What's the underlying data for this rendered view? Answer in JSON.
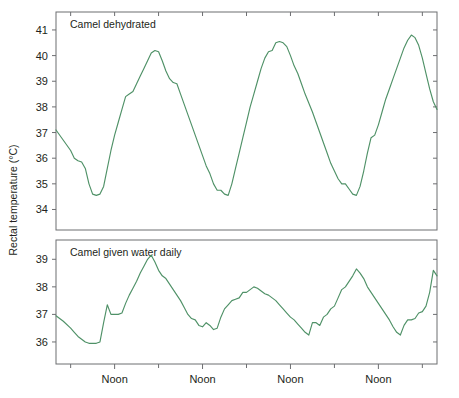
{
  "figure": {
    "background_color": "#ffffff",
    "axis_color": "#6d6e71",
    "text_color": "#231f20",
    "y_axis_title": "Rectal temperature (°C)"
  },
  "chart_data": {
    "type": "line",
    "title": "",
    "xlabel": "",
    "ylabel": "Rectal temperature (°C)",
    "grid": false,
    "legend": "none",
    "line_color": "#4f9167",
    "x_tick_labels": [
      "Noon",
      "Noon",
      "Noon",
      "Noon"
    ],
    "x_tick_label_positions_hours": [
      12,
      36,
      60,
      84
    ],
    "x_minor_tick_positions_hours": [
      0,
      24,
      48,
      72,
      96
    ],
    "xlim_hours": [
      -4,
      100
    ],
    "panels": [
      {
        "name": "camel-dehydrated",
        "label": "Camel dehydrated",
        "ylim": [
          33.2,
          41.7
        ],
        "y_ticks": [
          34,
          35,
          36,
          37,
          38,
          39,
          40,
          41
        ],
        "x": [
          -4,
          -2,
          0,
          1,
          2,
          3,
          4,
          5,
          6,
          7,
          8,
          9,
          10,
          11,
          12,
          13,
          14,
          15,
          16,
          17,
          18,
          19,
          20,
          21,
          22,
          23,
          24,
          25,
          26,
          27,
          28,
          29,
          30,
          31,
          32,
          33,
          34,
          35,
          36,
          37,
          38,
          39,
          40,
          41,
          42,
          43,
          44,
          45,
          46,
          47,
          48,
          49,
          50,
          51,
          52,
          53,
          54,
          55,
          56,
          57,
          58,
          59,
          60,
          61,
          62,
          63,
          64,
          65,
          66,
          67,
          68,
          69,
          70,
          71,
          72,
          73,
          74,
          75,
          76,
          77,
          78,
          79,
          80,
          81,
          82,
          83,
          84,
          85,
          86,
          87,
          88,
          89,
          90,
          91,
          92,
          93,
          94,
          95,
          96,
          97,
          98,
          99,
          100
        ],
        "y": [
          37.1,
          36.7,
          36.3,
          36.0,
          35.9,
          35.85,
          35.6,
          35.0,
          34.6,
          34.55,
          34.6,
          34.9,
          35.6,
          36.3,
          36.9,
          37.4,
          37.9,
          38.4,
          38.5,
          38.6,
          38.9,
          39.2,
          39.5,
          39.8,
          40.1,
          40.2,
          40.15,
          39.8,
          39.4,
          39.1,
          38.95,
          38.9,
          38.5,
          38.1,
          37.7,
          37.3,
          36.9,
          36.5,
          36.1,
          35.7,
          35.4,
          35.0,
          34.75,
          34.75,
          34.6,
          34.55,
          35.0,
          35.6,
          36.2,
          36.8,
          37.4,
          38.0,
          38.5,
          39.0,
          39.5,
          39.9,
          40.15,
          40.2,
          40.5,
          40.55,
          40.5,
          40.35,
          40.0,
          39.6,
          39.3,
          38.9,
          38.5,
          38.15,
          37.8,
          37.4,
          37.0,
          36.6,
          36.2,
          35.8,
          35.5,
          35.2,
          35.0,
          35.0,
          34.8,
          34.6,
          34.55,
          34.9,
          35.5,
          36.2,
          36.8,
          36.9,
          37.3,
          37.8,
          38.3,
          38.7,
          39.1,
          39.5,
          39.9,
          40.3,
          40.6,
          40.8,
          40.7,
          40.4,
          39.9,
          39.3,
          38.7,
          38.2,
          37.9
        ]
      },
      {
        "name": "camel-given-water-daily",
        "label": "Camel given water daily",
        "ylim": [
          35.2,
          39.7
        ],
        "y_ticks": [
          36,
          37,
          38,
          39
        ],
        "x": [
          -4,
          -2,
          0,
          1,
          2,
          3,
          4,
          5,
          6,
          7,
          8,
          9,
          10,
          11,
          12,
          13,
          14,
          15,
          16,
          17,
          18,
          19,
          20,
          21,
          22,
          23,
          24,
          25,
          26,
          27,
          28,
          29,
          30,
          31,
          32,
          33,
          34,
          35,
          36,
          37,
          38,
          39,
          40,
          41,
          42,
          43,
          44,
          45,
          46,
          47,
          48,
          49,
          50,
          51,
          52,
          53,
          54,
          55,
          56,
          57,
          58,
          59,
          60,
          61,
          62,
          63,
          64,
          65,
          66,
          67,
          68,
          69,
          70,
          71,
          72,
          73,
          74,
          75,
          76,
          77,
          78,
          79,
          80,
          81,
          82,
          83,
          84,
          85,
          86,
          87,
          88,
          89,
          90,
          91,
          92,
          93,
          94,
          95,
          96,
          97,
          98,
          99,
          100
        ],
        "y": [
          36.95,
          36.75,
          36.5,
          36.35,
          36.2,
          36.1,
          36.0,
          35.95,
          35.95,
          35.95,
          36.0,
          36.7,
          37.35,
          37.0,
          37.0,
          37.0,
          37.05,
          37.4,
          37.7,
          37.95,
          38.2,
          38.5,
          38.75,
          39.0,
          39.15,
          38.9,
          38.6,
          38.4,
          38.3,
          38.1,
          37.9,
          37.7,
          37.5,
          37.25,
          37.0,
          36.85,
          36.8,
          36.6,
          36.55,
          36.7,
          36.6,
          36.45,
          36.5,
          36.9,
          37.2,
          37.35,
          37.5,
          37.55,
          37.6,
          37.8,
          37.8,
          37.9,
          38.0,
          37.95,
          37.85,
          37.75,
          37.7,
          37.6,
          37.5,
          37.35,
          37.2,
          37.05,
          36.9,
          36.8,
          36.65,
          36.5,
          36.35,
          36.25,
          36.7,
          36.7,
          36.6,
          36.9,
          37.0,
          37.2,
          37.3,
          37.6,
          37.9,
          38.0,
          38.2,
          38.4,
          38.65,
          38.5,
          38.3,
          38.0,
          37.8,
          37.6,
          37.4,
          37.2,
          37.0,
          36.8,
          36.55,
          36.35,
          36.25,
          36.6,
          36.8,
          36.8,
          36.85,
          37.05,
          37.1,
          37.3,
          37.8,
          38.6,
          38.4,
          38.2,
          37.95
        ]
      }
    ]
  }
}
